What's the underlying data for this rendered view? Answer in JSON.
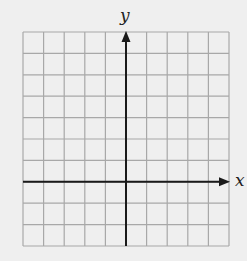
{
  "diagram": {
    "type": "coordinate-grid",
    "grid": {
      "columns": 10,
      "rows": 10,
      "left": 23,
      "top": 32,
      "right": 229,
      "bottom": 246,
      "line_color": "#a8a8a8",
      "axis_color": "#1a1a1a"
    },
    "x_axis": {
      "label": "x",
      "row_index": 7,
      "arrow": "right"
    },
    "y_axis": {
      "label": "y",
      "column_index": 5,
      "arrow": "up"
    },
    "background_color": "#efefef"
  }
}
